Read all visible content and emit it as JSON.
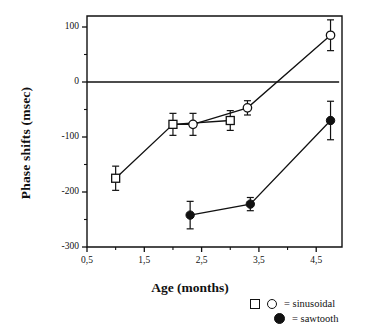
{
  "chart_data": {
    "type": "scatter",
    "title": "",
    "xlabel": "Age (months)",
    "ylabel": "Phase shifts (msec)",
    "xlim": [
      0.5,
      4.95
    ],
    "ylim": [
      -300,
      120
    ],
    "xticks": [
      0.5,
      1.5,
      2.5,
      3.5,
      4.5
    ],
    "xticklabels": [
      "0,5",
      "1,5",
      "2,5",
      "3,5",
      "4,5"
    ],
    "yticks": [
      100,
      0,
      -100,
      -200,
      -300
    ],
    "yticklabels": [
      "100",
      "0",
      "-100",
      "-200",
      "-300"
    ],
    "yminorticks": [
      50,
      -50,
      -150,
      -250
    ],
    "grid": false,
    "reference_line": {
      "y": 0,
      "x_start": 0.5,
      "x_end": 4.9
    },
    "legend_position": "below-right",
    "series": [
      {
        "name": "sinusoidal-square",
        "marker": "open-square",
        "points": [
          {
            "x": 1.0,
            "y": -175,
            "err": 22
          },
          {
            "x": 2.0,
            "y": -77,
            "err": 20
          },
          {
            "x": 3.0,
            "y": -70,
            "err": 18
          }
        ]
      },
      {
        "name": "sinusoidal-circle",
        "marker": "open-circle",
        "points": [
          {
            "x": 2.35,
            "y": -77,
            "err": 20
          },
          {
            "x": 3.3,
            "y": -47,
            "err": 13
          },
          {
            "x": 4.75,
            "y": 85,
            "err": 28
          }
        ]
      },
      {
        "name": "sawtooth",
        "marker": "filled-circle",
        "points": [
          {
            "x": 2.3,
            "y": -242,
            "err": 25
          },
          {
            "x": 3.35,
            "y": -222,
            "err": 12
          },
          {
            "x": 4.75,
            "y": -70,
            "err": 35
          }
        ]
      }
    ],
    "connections": [
      {
        "series": "sinusoidal-square",
        "path": [
          [
            1.0,
            -175
          ],
          [
            2.0,
            -77
          ],
          [
            3.0,
            -70
          ]
        ]
      },
      {
        "series": "sinusoidal-circle",
        "path": [
          [
            2.0,
            -77
          ],
          [
            2.35,
            -77
          ],
          [
            3.3,
            -47
          ],
          [
            4.75,
            85
          ]
        ]
      },
      {
        "series": "sawtooth",
        "path": [
          [
            2.3,
            -242
          ],
          [
            3.35,
            -222
          ],
          [
            4.75,
            -70
          ]
        ]
      }
    ]
  },
  "legend": {
    "entries": [
      {
        "markers": [
          "open-square",
          "open-circle"
        ],
        "label": "= sinusoidal"
      },
      {
        "markers": [
          "filled-circle"
        ],
        "label": "= sawtooth"
      }
    ],
    "sinusoidal_label": "= sinusoidal",
    "sawtooth_label": "= sawtooth"
  },
  "colors": {
    "axis": "#111111",
    "line": "#111111",
    "marker_fill": "#ffffff",
    "sawtooth_fill": "#111111",
    "background": "#ffffff"
  }
}
